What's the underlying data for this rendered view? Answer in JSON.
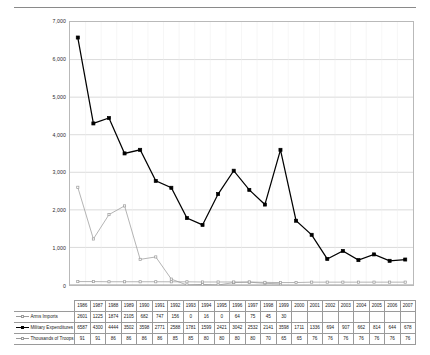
{
  "chart_data": {
    "type": "line",
    "title": "",
    "xlabel": "",
    "ylabel": "",
    "ylim": [
      0,
      7000
    ],
    "ytick_labels": [
      "7,000",
      "6,000",
      "5,000",
      "4,000",
      "3,000",
      "2,000",
      "1,000",
      "0"
    ],
    "yticks": [
      7000,
      6000,
      5000,
      4000,
      3000,
      2000,
      1000,
      0
    ],
    "grid": true,
    "legend_position": "table-left",
    "categories": [
      "1986",
      "1987",
      "1988",
      "1989",
      "1990",
      "1991",
      "1992",
      "1993",
      "1994",
      "1995",
      "1996",
      "1997",
      "1998",
      "1999",
      "2000",
      "2001",
      "2002",
      "2003",
      "2004",
      "2005",
      "2006",
      "2007"
    ],
    "series": [
      {
        "name": "Arms Imports",
        "marker": "open-square",
        "color": "#9a9a9a",
        "values": [
          2601,
          1225,
          1874,
          2105,
          682,
          747,
          156,
          0,
          16,
          0,
          64,
          75,
          45,
          30,
          null,
          null,
          null,
          null,
          null,
          null,
          null,
          null
        ],
        "display": [
          "2601",
          "1225",
          "1874",
          "2105",
          "682",
          "747",
          "156",
          "0",
          "16",
          "0",
          "64",
          "75",
          "45",
          "30",
          "",
          "",
          "",
          "",
          "",
          "",
          "",
          ""
        ]
      },
      {
        "name": "Military Expenditures",
        "marker": "filled-square",
        "color": "#000000",
        "values": [
          6587,
          4300,
          4444,
          3502,
          3598,
          2771,
          2588,
          1781,
          1599,
          2421,
          3042,
          2532,
          2141,
          3598,
          1711,
          1336,
          694,
          907,
          662,
          814,
          644,
          678
        ],
        "display": [
          "6587",
          "4300",
          "4444",
          "3502",
          "3598",
          "2771",
          "2588",
          "1781",
          "1599",
          "2421",
          "3042",
          "2532",
          "2141",
          "3598",
          "1711",
          "1336",
          "694",
          "907",
          "662",
          "814",
          "644",
          "678"
        ]
      },
      {
        "name": "Thousands of Troops",
        "marker": "open-square",
        "color": "#9a9a9a",
        "values": [
          91,
          91,
          86,
          86,
          86,
          86,
          85,
          85,
          80,
          80,
          80,
          80,
          70,
          65,
          65,
          76,
          76,
          76,
          76,
          76,
          76,
          76
        ],
        "display": [
          "91",
          "91",
          "86",
          "86",
          "86",
          "86",
          "85",
          "85",
          "80",
          "80",
          "80",
          "80",
          "70",
          "65",
          "65",
          "76",
          "76",
          "76",
          "76",
          "76",
          "76",
          "76"
        ]
      }
    ]
  }
}
